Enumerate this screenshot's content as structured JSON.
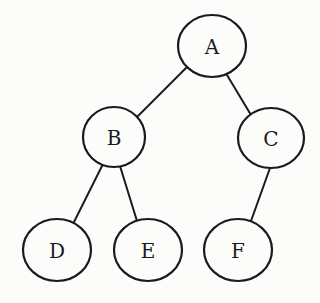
{
  "diagram": {
    "type": "binary-tree",
    "stroke_color": "#1a1a1a",
    "background_color": "#fcfcfb",
    "nodes": [
      {
        "id": "A",
        "label": "A",
        "cx": 212,
        "cy": 46,
        "rx": 34,
        "ry": 31
      },
      {
        "id": "B",
        "label": "B",
        "cx": 114,
        "cy": 137,
        "rx": 31,
        "ry": 30
      },
      {
        "id": "C",
        "label": "C",
        "cx": 271,
        "cy": 138,
        "rx": 33,
        "ry": 30
      },
      {
        "id": "D",
        "label": "D",
        "cx": 57,
        "cy": 250,
        "rx": 34,
        "ry": 31
      },
      {
        "id": "E",
        "label": "E",
        "cx": 148,
        "cy": 250,
        "rx": 34,
        "ry": 31
      },
      {
        "id": "F",
        "label": "F",
        "cx": 238,
        "cy": 250,
        "rx": 34,
        "ry": 31
      }
    ],
    "edges": [
      {
        "from": "A",
        "to": "B",
        "x1": 187,
        "y1": 67,
        "x2": 137,
        "y2": 117
      },
      {
        "from": "A",
        "to": "C",
        "x1": 227,
        "y1": 75,
        "x2": 251,
        "y2": 115
      },
      {
        "from": "B",
        "to": "D",
        "x1": 102,
        "y1": 166,
        "x2": 74,
        "y2": 222
      },
      {
        "from": "B",
        "to": "E",
        "x1": 120,
        "y1": 166,
        "x2": 137,
        "y2": 221
      },
      {
        "from": "C",
        "to": "F",
        "x1": 270,
        "y1": 168,
        "x2": 251,
        "y2": 221
      }
    ]
  }
}
